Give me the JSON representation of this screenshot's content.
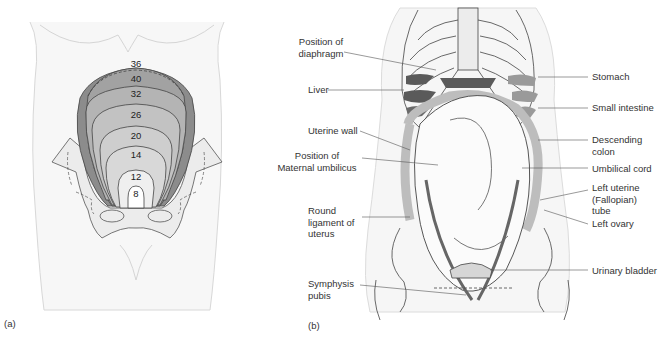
{
  "figure": {
    "panels": [
      {
        "id": "a",
        "label": "(a)",
        "description": "Fundal height by gestational week",
        "week_contours": [
          {
            "week": "36",
            "x": 136,
            "y": 64
          },
          {
            "week": "40",
            "x": 136,
            "y": 79
          },
          {
            "week": "32",
            "x": 136,
            "y": 94
          },
          {
            "week": "26",
            "x": 136,
            "y": 115
          },
          {
            "week": "20",
            "x": 136,
            "y": 136
          },
          {
            "week": "14",
            "x": 136,
            "y": 155
          },
          {
            "week": "12",
            "x": 136,
            "y": 177
          },
          {
            "week": "8",
            "x": 136,
            "y": 193
          }
        ]
      },
      {
        "id": "b",
        "label": "(b)",
        "description": "Abdominal anatomy in late pregnancy",
        "labels_left": [
          {
            "key": "diaphragm",
            "text": "Position of\ndiaphragm"
          },
          {
            "key": "liver",
            "text": "Liver"
          },
          {
            "key": "uterine_wall",
            "text": "Uterine wall"
          },
          {
            "key": "umbilicus",
            "text": "Position of\nMaternal umbilicus"
          },
          {
            "key": "round_ligament",
            "text": "Round\nligament of\nuterus"
          },
          {
            "key": "symphysis",
            "text": "Symphysis\npubis"
          }
        ],
        "labels_right": [
          {
            "key": "stomach",
            "text": "Stomach"
          },
          {
            "key": "small_intestine",
            "text": "Small intestine"
          },
          {
            "key": "descending_colon",
            "text": "Descending\ncolon"
          },
          {
            "key": "umbilical_cord",
            "text": "Umbilical cord"
          },
          {
            "key": "fallopian_tube",
            "text": "Left uterine\n(Fallopian)\ntube"
          },
          {
            "key": "left_ovary",
            "text": "Left ovary"
          },
          {
            "key": "urinary_bladder",
            "text": "Urinary bladder"
          }
        ]
      }
    ],
    "colors": {
      "outline": "#444444",
      "body_fill": "#f4f4f4",
      "pelvis_fill": "#ececec",
      "uterus_dark": "#8c8c8c",
      "uterus_mid": "#a9a9a9",
      "uterus_light": "#c6c6c6",
      "uterus_pale": "#dedede",
      "organ_dark": "#5a5a5a",
      "intestine": "#bdbdbd"
    }
  }
}
